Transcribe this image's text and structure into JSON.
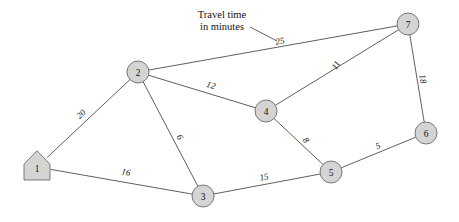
{
  "diagram": {
    "annotation": {
      "line1": "Travel time",
      "line2": "in minutes",
      "x": 222,
      "y": 18,
      "leader": {
        "x1": 250,
        "y1": 27,
        "x2": 277,
        "y2": 41
      }
    },
    "style": {
      "node_fill": "#d4d4d4",
      "node_stroke": "#6b6b6b",
      "edge_stroke": "#4d4d4d",
      "background": "#ffffff",
      "text_color": "#111111"
    },
    "nodes": [
      {
        "id": "1",
        "label": "1",
        "shape": "house",
        "x": 37,
        "y": 167,
        "r": 13
      },
      {
        "id": "2",
        "label": "2",
        "shape": "circle",
        "x": 138,
        "y": 72,
        "r": 11
      },
      {
        "id": "3",
        "label": "3",
        "shape": "circle",
        "x": 203,
        "y": 196,
        "r": 11
      },
      {
        "id": "4",
        "label": "4",
        "shape": "circle",
        "x": 266,
        "y": 111,
        "r": 11
      },
      {
        "id": "5",
        "label": "5",
        "shape": "circle",
        "x": 331,
        "y": 172,
        "r": 11
      },
      {
        "id": "6",
        "label": "6",
        "shape": "circle",
        "x": 426,
        "y": 133,
        "r": 11
      },
      {
        "id": "7",
        "label": "7",
        "shape": "circle",
        "x": 408,
        "y": 24,
        "r": 11
      }
    ],
    "edges": [
      {
        "from": "1",
        "to": "2",
        "weight": "20",
        "lx": 81,
        "ly": 114,
        "rot": -43
      },
      {
        "from": "1",
        "to": "3",
        "weight": "16",
        "lx": 126,
        "ly": 172,
        "rot": 10
      },
      {
        "from": "2",
        "to": "3",
        "weight": "6",
        "lx": 180,
        "ly": 137,
        "rot": 62
      },
      {
        "from": "2",
        "to": "4",
        "weight": "12",
        "lx": 211,
        "ly": 85,
        "rot": 16
      },
      {
        "from": "2",
        "to": "7",
        "weight": "25",
        "lx": 280,
        "ly": 41,
        "rot": -10
      },
      {
        "from": "4",
        "to": "7",
        "weight": "11",
        "lx": 336,
        "ly": 65,
        "rot": -58
      },
      {
        "from": "4",
        "to": "5",
        "weight": "8",
        "lx": 306,
        "ly": 140,
        "rot": 58
      },
      {
        "from": "3",
        "to": "5",
        "weight": "15",
        "lx": 264,
        "ly": 177,
        "rot": -11
      },
      {
        "from": "5",
        "to": "6",
        "weight": "5",
        "lx": 378,
        "ly": 146,
        "rot": -22
      },
      {
        "from": "6",
        "to": "7",
        "weight": "18",
        "lx": 423,
        "ly": 79,
        "rot": 80
      }
    ]
  }
}
